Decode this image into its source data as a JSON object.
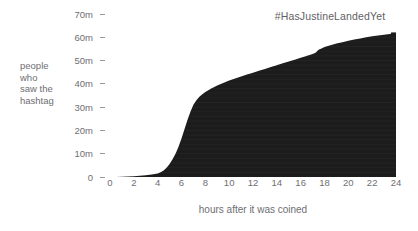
{
  "chart_data": {
    "type": "area",
    "title": "#HasJustineLandedYet",
    "xlabel": "hours after it was coined",
    "ylabel": "people who saw the hashtag",
    "ylabel_lines": [
      "people",
      "who",
      "saw the",
      "hashtag"
    ],
    "xlim": [
      0,
      24
    ],
    "ylim": [
      0,
      70
    ],
    "grid": false,
    "legend": null,
    "y_unit": "m",
    "y_ticks": [
      0,
      10,
      20,
      30,
      40,
      50,
      60,
      70
    ],
    "y_tick_labels": [
      "0",
      "10m",
      "20m",
      "30m",
      "40m",
      "50m",
      "60m",
      "70m"
    ],
    "x_ticks": [
      0,
      2,
      4,
      6,
      8,
      10,
      12,
      14,
      16,
      18,
      20,
      22,
      24
    ],
    "x_tick_labels": [
      "0",
      "2",
      "4",
      "6",
      "8",
      "10",
      "12",
      "14",
      "16",
      "18",
      "20",
      "22",
      "24"
    ],
    "fill_color": "#1c1c1c",
    "background_color": "#ffffff",
    "text_color": "#6e6e72",
    "series": [
      {
        "name": "cumulative impressions",
        "x": [
          0,
          0.5,
          1,
          1.5,
          2,
          2.5,
          3,
          3.5,
          4,
          4.25,
          4.5,
          4.75,
          5,
          5.25,
          5.5,
          5.75,
          6,
          6.25,
          6.5,
          6.75,
          7,
          7.25,
          7.5,
          7.75,
          8,
          8.5,
          9,
          9.5,
          10,
          10.5,
          11,
          11.5,
          12,
          12.5,
          13,
          13.5,
          14,
          14.5,
          15,
          15.5,
          16,
          16.5,
          17,
          17.25,
          17.5,
          17.75,
          18,
          18.5,
          19,
          19.5,
          20,
          20.5,
          21,
          21.5,
          22,
          22.5,
          23,
          23.3,
          23.55,
          23.6,
          24
        ],
        "values": [
          0,
          0.05,
          0.1,
          0.2,
          0.3,
          0.5,
          0.8,
          1.1,
          1.5,
          2.0,
          2.8,
          4.0,
          5.6,
          7.6,
          10.0,
          13.0,
          16.5,
          20.5,
          24.5,
          28.0,
          31.0,
          33.0,
          34.5,
          35.5,
          36.5,
          38.0,
          39.3,
          40.4,
          41.4,
          42.3,
          43.2,
          44.0,
          44.8,
          45.6,
          46.4,
          47.2,
          48.0,
          48.8,
          49.6,
          50.4,
          51.2,
          52.0,
          52.8,
          53.4,
          54.6,
          55.2,
          55.8,
          56.6,
          57.3,
          57.9,
          58.5,
          59.0,
          59.5,
          60.0,
          60.4,
          60.8,
          61.1,
          61.3,
          61.4,
          62.1,
          62.1
        ]
      }
    ]
  }
}
